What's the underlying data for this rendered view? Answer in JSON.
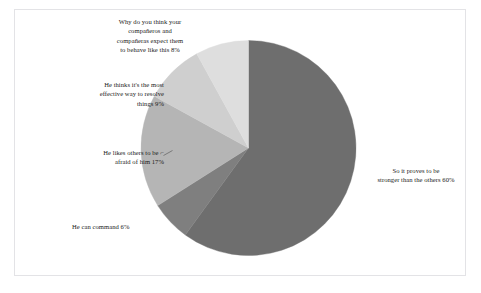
{
  "chart_data": {
    "type": "pie",
    "title": "",
    "subtitle": "",
    "xlabel": "",
    "ylabel": "",
    "legend_position": "none",
    "grid": false,
    "start_angle_deg": 0,
    "direction": "clockwise",
    "categories": [
      "Why do you think your compañeros and compañeras expect them to behave like this",
      "He thinks it's the most effective way to resolve things",
      "He likes others to be afraid of him",
      "He can command",
      "So it proves to be stronger than the others"
    ],
    "values": [
      8,
      9,
      17,
      6,
      60
    ],
    "value_suffix": "%",
    "colors": [
      "#dedede",
      "#cfcfcf",
      "#b5b5b5",
      "#7f7f7f",
      "#6e6e6e"
    ],
    "slices": [
      {
        "label": "So it proves to be stronger than the others",
        "value": 60,
        "display": "So it proves to be\nstronger than the others 60%",
        "color": "#6e6e6e",
        "start_deg": 0,
        "end_deg": 216
      },
      {
        "label": "He can command",
        "value": 6,
        "display": "He can command 6%",
        "color": "#7f7f7f",
        "start_deg": 216,
        "end_deg": 237.6
      },
      {
        "label": "He likes others to be afraid of him",
        "value": 17,
        "display": "He likes others to be  ⌐\nafraid of him 17%",
        "color": "#b5b5b5",
        "start_deg": 237.6,
        "end_deg": 298.8
      },
      {
        "label": "He thinks it's the most effective way to resolve things",
        "value": 9,
        "display": "He thinks it's the most\neffective way to resolve\nthings 9%",
        "color": "#cfcfcf",
        "start_deg": 298.8,
        "end_deg": 331.2
      },
      {
        "label": "Why do you think your compañeros and compañeras expect them to behave like this",
        "value": 8,
        "display": "Why do you think your\ncompañeros and\ncompañeras expect them\nto behave like this 8%",
        "color": "#dedede",
        "start_deg": 331.2,
        "end_deg": 360
      }
    ]
  },
  "figure": {
    "border_color": "#e3e3e6",
    "background": "#ffffff",
    "text_color": "#1a1a1a"
  }
}
